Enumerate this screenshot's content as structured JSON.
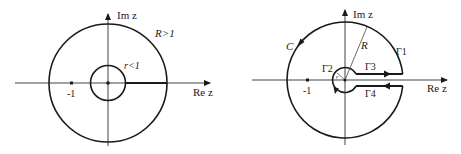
{
  "left_figure": {
    "axis_x_label": "Re z",
    "axis_y_label": "Im z",
    "outer_circle_label": "R>1",
    "inner_circle_label": "r<1",
    "tick_label": "-1"
  },
  "right_figure": {
    "axis_x_label": "Re z",
    "axis_y_label": "Im z",
    "contour_label": "C",
    "radius_label": "R",
    "inner_radius_label": "r",
    "gamma1": "Γ1",
    "gamma2": "Γ2",
    "gamma3": "Γ3",
    "gamma4": "Γ4",
    "tick_label": "-1"
  },
  "colors": {
    "stroke": "#1a1a1a",
    "axis": "#444444",
    "background": "#ffffff"
  }
}
